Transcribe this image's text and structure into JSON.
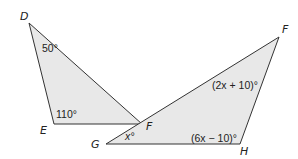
{
  "triangles": [
    {
      "name": "DEF",
      "vertices": [
        {
          "label": "D",
          "x": 29,
          "y": 23
        },
        {
          "label": "E",
          "x": 54,
          "y": 124
        },
        {
          "label": "F",
          "x": 142,
          "y": 124
        }
      ],
      "angles": [
        {
          "vertex": "D",
          "text": "50°"
        },
        {
          "vertex": "E",
          "text": "110°"
        }
      ]
    },
    {
      "name": "FGH",
      "vertices": [
        {
          "label": "F",
          "x": 279,
          "y": 37
        },
        {
          "label": "G",
          "x": 106,
          "y": 144
        },
        {
          "label": "H",
          "x": 240,
          "y": 144
        }
      ],
      "angles": [
        {
          "vertex": "F",
          "text": "(2x + 10)°"
        },
        {
          "vertex": "G",
          "text": "x°"
        },
        {
          "vertex": "H",
          "text": "(6x − 10)°"
        }
      ]
    }
  ],
  "style": {
    "fill": "#e8e8e8",
    "stroke": "#333333"
  }
}
